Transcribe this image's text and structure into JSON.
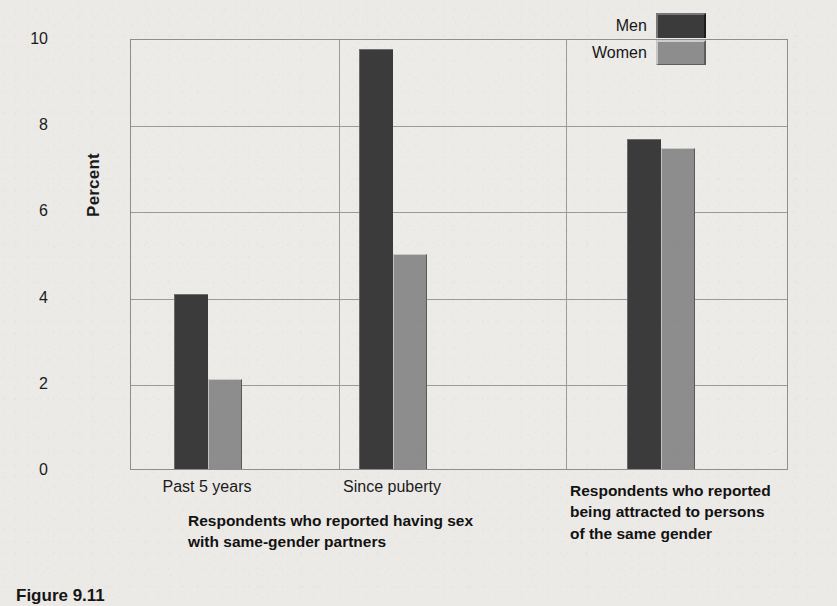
{
  "figure": {
    "number_label": "Figure 9.11",
    "y_axis_title": "Percent"
  },
  "legend": {
    "position": "top-right",
    "entries": [
      {
        "label": "Men",
        "color": "#3b3b3b",
        "swatch": "men-swatch"
      },
      {
        "label": "Women",
        "color": "#8d8d8d",
        "swatch": "women-swatch"
      }
    ]
  },
  "captions": {
    "sex": "Respondents who reported having sex\nwith same-gender partners",
    "attraction": "Respondents who reported\nbeing attracted to persons\nof the same gender"
  },
  "chart_data": {
    "type": "bar",
    "title": "",
    "subtitle": "",
    "xlabel": "",
    "ylabel": "Percent",
    "ylim": [
      0,
      10
    ],
    "yticks": [
      10,
      8,
      6,
      4,
      2,
      0
    ],
    "ytick_labels": [
      "10",
      "8",
      "6",
      "4",
      "2",
      "0"
    ],
    "grid": true,
    "grid_axis": "both",
    "legend_position": "top-right",
    "categories": [
      "Past 5 years",
      "Since puberty",
      ""
    ],
    "category_labels_shown": [
      "Past 5 years",
      "Since puberty"
    ],
    "series": [
      {
        "name": "Men",
        "color": "#3b3b3b",
        "values": [
          4.05,
          9.75,
          7.65
        ]
      },
      {
        "name": "Women",
        "color": "#8d8d8d",
        "values": [
          2.1,
          5.0,
          7.45
        ]
      }
    ],
    "groups": [
      {
        "tick_label": "Past 5 years",
        "caption": "Respondents who reported having sex with same-gender partners",
        "men": 4.05,
        "women": 2.1
      },
      {
        "tick_label": "Since puberty",
        "caption": "Respondents who reported having sex with same-gender partners",
        "men": 9.75,
        "women": 5.0
      },
      {
        "tick_label": "",
        "caption": "Respondents who reported being attracted to persons of the same gender",
        "men": 7.65,
        "women": 7.45
      }
    ]
  },
  "colors": {
    "men_bar": "#3b3b3b",
    "women_bar": "#8d8d8d",
    "grid": "#9b9b9b",
    "frame": "#8e8e8e",
    "background": "#eceae7",
    "text": "#1b1b1b"
  }
}
